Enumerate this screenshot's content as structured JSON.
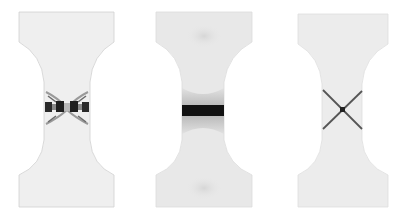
{
  "figure": {
    "panels": [
      {
        "id": "left",
        "pattern": "fragmented cracks",
        "fill": "#efefef",
        "outline": "#d0d0d0",
        "accent": "#2a2a2a"
      },
      {
        "id": "middle",
        "pattern": "horizontal band",
        "fill": "#e8e8e8",
        "outline": "#dcdcdc",
        "accent": "#111111"
      },
      {
        "id": "right",
        "pattern": "X-shaped shear bands",
        "fill": "#ececec",
        "outline": "#dedede",
        "accent": "#4a4a4a"
      }
    ]
  }
}
